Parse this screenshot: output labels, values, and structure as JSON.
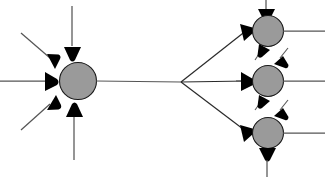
{
  "figure": {
    "title": "Neuronal divergence and convergence schematic",
    "background_color": "#ffffff",
    "soma_fill_color": "#9a9a9a",
    "soma_stroke_color": "#1a1a1a",
    "fiber_color": "#555555",
    "bouton_color": "#000000"
  },
  "elements": {
    "presynaptic_neuron_label": "presynaptic neuron",
    "postsynaptic_neuron_label": "postsynaptic neuron",
    "axon_label": "axon",
    "dendrite_label": "dendrite",
    "synaptic_bouton_label": "synaptic terminal",
    "branch_point_label": "axon branch point"
  },
  "chart_data": {
    "type": "diagram",
    "title": "Neuronal divergence and convergence schematic",
    "somas": [
      {
        "id": "presynaptic",
        "cx": 78,
        "cy": 81,
        "r": 18.5,
        "fill": "#9a9a9a"
      },
      {
        "id": "postsynaptic-top",
        "cx": 268,
        "cy": 31,
        "r": 15.5,
        "fill": "#9a9a9a"
      },
      {
        "id": "postsynaptic-middle",
        "cx": 268,
        "cy": 81,
        "r": 15.5,
        "fill": "#9a9a9a"
      },
      {
        "id": "postsynaptic-bottom",
        "cx": 268,
        "cy": 133,
        "r": 15.5,
        "fill": "#9a9a9a"
      }
    ],
    "branch_point": {
      "x": 181,
      "y": 82
    },
    "input_terminal_count": 5,
    "output_branch_count": 3,
    "postsynaptic_count": 3
  }
}
